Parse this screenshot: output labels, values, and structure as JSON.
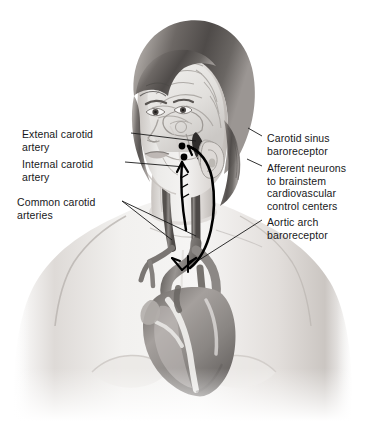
{
  "figure": {
    "width": 367,
    "height": 421,
    "background": "#ffffff"
  },
  "labels": {
    "left": [
      {
        "id": "external-carotid-artery",
        "text": "Extenal carotid\nartery",
        "x": 22,
        "y": 128
      },
      {
        "id": "internal-carotid-artery",
        "text": "Internal carotid\nartery",
        "x": 22,
        "y": 158
      },
      {
        "id": "common-carotid-arteries",
        "text": "Common carotid\narteries",
        "x": 17,
        "y": 196
      }
    ],
    "right": [
      {
        "id": "carotid-sinus-baroreceptor",
        "text": "Carotid sinus\nbaroreceptor",
        "x": 267,
        "y": 132
      },
      {
        "id": "afferent-neurons",
        "text": "Afferent neurons\nto brainstem\ncardiovascular\ncontrol centers",
        "x": 267,
        "y": 162
      },
      {
        "id": "aortic-arch-baroreceptor",
        "text": "Aortic arch\nbaroreceptor",
        "x": 267,
        "y": 216
      }
    ]
  },
  "anatomy": {
    "structures": [
      "brain-midsagittal-section",
      "brainstem",
      "external-carotid-artery",
      "internal-carotid-artery",
      "common-carotid-artery-left",
      "common-carotid-artery-right",
      "carotid-sinus",
      "aortic-arch",
      "heart",
      "ear",
      "face"
    ],
    "markers": [
      {
        "id": "carotid-sinus-receptor-upper",
        "x": 182,
        "y": 146
      },
      {
        "id": "carotid-sinus-receptor-lower",
        "x": 184,
        "y": 156
      }
    ]
  },
  "colors": {
    "background": "#ffffff",
    "text": "#17181a",
    "leader_line": "#1a1a1a",
    "nerve_pathway": "#000000",
    "skin_light": "#f0eeec",
    "skin_mid": "#d8d4d1",
    "skin_shadow": "#b6b1ad",
    "hair_dark": "#5c5855",
    "hair_mid": "#8d8884",
    "vessel_dark": "#6e6a67",
    "vessel_mid": "#9a9693",
    "heart_dark": "#7a7673",
    "heart_highlight": "#efeeec"
  }
}
